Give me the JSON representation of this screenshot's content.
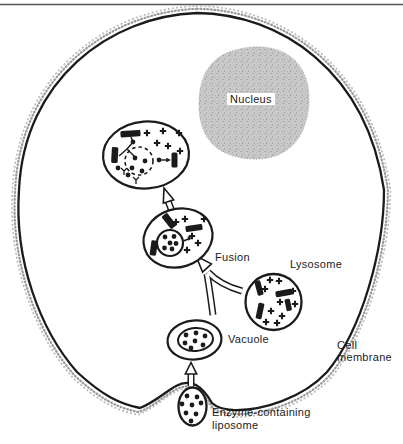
{
  "figure": {
    "labels": {
      "nucleus": "Nucleus",
      "fusion": "Fusion",
      "lysosome": "Lysosome",
      "vacuole": "Vacuole",
      "cell_membrane": [
        "Cell",
        "membrane"
      ],
      "enzyme_liposome": [
        "Enzyme-containing",
        "liposome"
      ]
    },
    "colors": {
      "ink": "#1b1b1b",
      "background": "#ffffff",
      "nucleus_fill": "#cbcbcb",
      "nucleus_stipple": "#999999",
      "membrane_stipple": "#a0a0a0"
    }
  }
}
